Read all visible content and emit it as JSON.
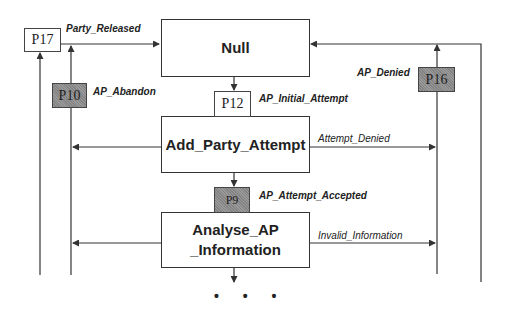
{
  "diagram": {
    "type": "state-transition-petri",
    "states": [
      {
        "id": "null",
        "label": "Null"
      },
      {
        "id": "add_party_attempt",
        "label": "Add_Party_Attempt"
      },
      {
        "id": "analyse_ap_information",
        "label_line1": "Analyse_AP",
        "label_line2": "_Information"
      }
    ],
    "places": [
      {
        "id": "P17",
        "label": "P17",
        "shaded": false
      },
      {
        "id": "P10",
        "label": "P10",
        "shaded": true
      },
      {
        "id": "P12",
        "label": "P12",
        "shaded": false
      },
      {
        "id": "P9",
        "label": "P9",
        "shaded": true
      },
      {
        "id": "P16",
        "label": "P16",
        "shaded": true
      }
    ],
    "transitions": [
      {
        "id": "party_released",
        "label": "Party_Released",
        "bold": true
      },
      {
        "id": "ap_abandon",
        "label": "AP_Abandon",
        "bold": true
      },
      {
        "id": "ap_initial_attempt",
        "label": "AP_Initial_Attempt",
        "bold": true
      },
      {
        "id": "ap_denied",
        "label": "AP_Denied",
        "bold": true
      },
      {
        "id": "attempt_denied",
        "label": "Attempt_Denied",
        "bold": false
      },
      {
        "id": "ap_attempt_accepted",
        "label": "AP_Attempt_Accepted",
        "bold": true
      },
      {
        "id": "invalid_information",
        "label": "Invalid_Information",
        "bold": false
      }
    ],
    "continuation": "• • •",
    "colors": {
      "line": "#333333",
      "shaded_place": "#9a9a9a",
      "background": "#ffffff"
    }
  }
}
